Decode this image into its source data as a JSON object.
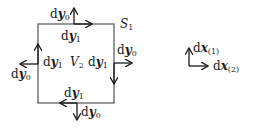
{
  "diagram": {
    "region_label": "V",
    "region_sub": "2",
    "surface_label": "S",
    "surface_sub": "1",
    "edges": {
      "top": {
        "along": "y",
        "along_sub": "1",
        "normal": "y",
        "normal_sub": "0"
      },
      "left": {
        "along": "y",
        "along_sub": "1",
        "normal": "y",
        "normal_sub": "0"
      },
      "right": {
        "along": "y",
        "along_sub": "1",
        "normal": "y",
        "normal_sub": "0"
      },
      "bottom": {
        "along": "y",
        "along_sub": "1",
        "normal": "y",
        "normal_sub": "0"
      }
    },
    "axes": {
      "up": {
        "prefix": "d",
        "var": "x",
        "sub": "(1)"
      },
      "right": {
        "prefix": "d",
        "var": "x",
        "sub": "(2)"
      }
    },
    "d": "d"
  }
}
